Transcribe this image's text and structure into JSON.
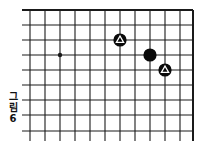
{
  "caption": {
    "chars": [
      "그",
      "림",
      "6"
    ],
    "text": "그림 6"
  },
  "board": {
    "colors": {
      "line": "#1a1a1a",
      "background": "#ffffff",
      "black_stone": "#0a0a0a",
      "marker": "#ffffff"
    },
    "vertical_lines_x": [
      30,
      45,
      60,
      75,
      90,
      105,
      120,
      135,
      150,
      165,
      180
    ],
    "edge_right_x": 193,
    "horizontal_lines_y": [
      25,
      40,
      55,
      70,
      85,
      100,
      115,
      131
    ],
    "edge_top_y": 10,
    "line_left_x": 22,
    "line_bottom_y": 141,
    "star_points": [
      {
        "x": 60,
        "y": 55
      }
    ],
    "stones": [
      {
        "color": "black",
        "x": 120,
        "y": 40,
        "marker": "triangle"
      },
      {
        "color": "black",
        "x": 150,
        "y": 55,
        "marker": "none"
      },
      {
        "color": "black",
        "x": 165,
        "y": 70,
        "marker": "triangle"
      }
    ]
  }
}
